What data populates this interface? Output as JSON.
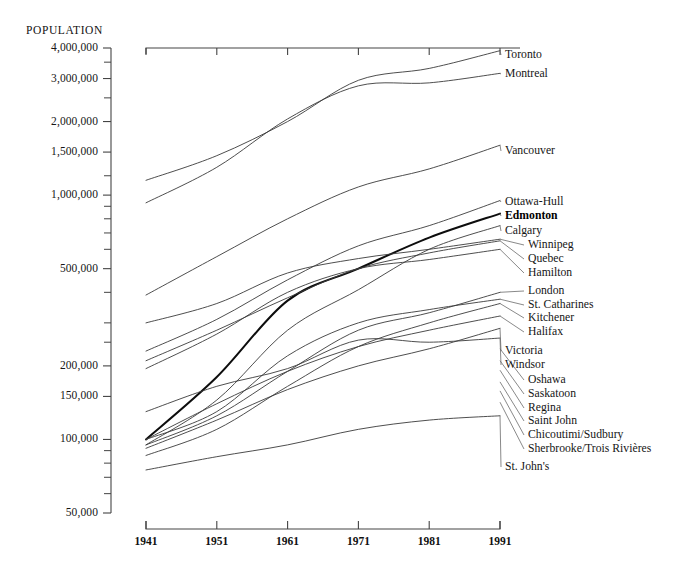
{
  "chart_data": {
    "type": "line",
    "title": "",
    "ylabel": "POPULATION",
    "xlabel": "",
    "yscale": "log",
    "ylim": [
      50000,
      4000000
    ],
    "xlim": [
      1941,
      1991
    ],
    "grid": false,
    "legend_position": "right-inline-labels",
    "x": [
      1941,
      1951,
      1961,
      1971,
      1981,
      1991
    ],
    "ytick_labels": [
      "4,000,000",
      "3,000,000",
      "2,000,000",
      "1,500,000",
      "1,000,000",
      "500,000",
      "200,000",
      "150,000",
      "100,000",
      "50,000"
    ],
    "ytick_values": [
      4000000,
      3000000,
      2000000,
      1500000,
      1000000,
      500000,
      200000,
      150000,
      100000,
      50000
    ],
    "xtick_labels": [
      "1941",
      "1951",
      "1961",
      "1971",
      "1981",
      "1991"
    ],
    "series": [
      {
        "name": "Toronto",
        "emphasis": false,
        "values": [
          1150000,
          1450000,
          2000000,
          2950000,
          3300000,
          3900000
        ]
      },
      {
        "name": "Montreal",
        "emphasis": false,
        "values": [
          930000,
          1300000,
          2050000,
          2800000,
          2880000,
          3150000
        ]
      },
      {
        "name": "Vancouver",
        "emphasis": false,
        "values": [
          390000,
          560000,
          800000,
          1080000,
          1280000,
          1600000
        ]
      },
      {
        "name": "Ottawa-Hull",
        "emphasis": false,
        "values": [
          230000,
          310000,
          450000,
          620000,
          750000,
          950000
        ]
      },
      {
        "name": "Edmonton",
        "emphasis": true,
        "values": [
          100000,
          180000,
          370000,
          500000,
          670000,
          840000
        ]
      },
      {
        "name": "Calgary",
        "emphasis": false,
        "values": [
          95000,
          145000,
          280000,
          410000,
          600000,
          750000
        ]
      },
      {
        "name": "Winnipeg",
        "emphasis": false,
        "values": [
          300000,
          360000,
          480000,
          550000,
          600000,
          660000
        ]
      },
      {
        "name": "Quebec",
        "emphasis": false,
        "values": [
          210000,
          280000,
          380000,
          500000,
          580000,
          650000
        ]
      },
      {
        "name": "Hamilton",
        "emphasis": false,
        "values": [
          195000,
          270000,
          400000,
          500000,
          545000,
          600000
        ]
      },
      {
        "name": "London",
        "emphasis": false,
        "values": [
          95000,
          125000,
          190000,
          280000,
          330000,
          400000
        ]
      },
      {
        "name": "St. Catharines",
        "emphasis": false,
        "values": [
          100000,
          130000,
          220000,
          300000,
          340000,
          375000
        ]
      },
      {
        "name": "Kitchener",
        "emphasis": false,
        "values": [
          86000,
          110000,
          165000,
          240000,
          300000,
          360000
        ]
      },
      {
        "name": "Halifax",
        "emphasis": false,
        "values": [
          100000,
          140000,
          190000,
          240000,
          280000,
          320000
        ]
      },
      {
        "name": "Victoria",
        "emphasis": false,
        "values": [
          92000,
          120000,
          160000,
          200000,
          235000,
          285000
        ]
      },
      {
        "name": "Windsor",
        "emphasis": false,
        "values": [
          130000,
          165000,
          195000,
          255000,
          250000,
          260000
        ]
      },
      {
        "name": "Oshawa",
        "emphasis": false,
        "values": [
          null,
          null,
          null,
          null,
          null,
          235000
        ]
      },
      {
        "name": "Saskatoon",
        "emphasis": false,
        "values": [
          null,
          null,
          null,
          null,
          null,
          210000
        ]
      },
      {
        "name": "Regina",
        "emphasis": false,
        "values": [
          null,
          null,
          null,
          null,
          null,
          192000
        ]
      },
      {
        "name": "Saint John",
        "emphasis": false,
        "values": [
          null,
          null,
          null,
          null,
          null,
          172000
        ]
      },
      {
        "name": "Chicoutimi/Sudbury",
        "emphasis": false,
        "values": [
          null,
          null,
          null,
          null,
          null,
          158000
        ]
      },
      {
        "name": "Sherbrooke/Trois Rivières",
        "emphasis": false,
        "values": [
          null,
          null,
          null,
          null,
          null,
          142000
        ]
      },
      {
        "name": "St. John's",
        "emphasis": false,
        "values": [
          75000,
          85000,
          95000,
          110000,
          120000,
          125000
        ]
      }
    ],
    "right_labels": [
      {
        "text": "Toronto",
        "bold": false
      },
      {
        "text": "Montreal",
        "bold": false
      },
      {
        "text": "Vancouver",
        "bold": false
      },
      {
        "text": "Ottawa-Hull",
        "bold": false
      },
      {
        "text": "Edmonton",
        "bold": true
      },
      {
        "text": "Calgary",
        "bold": false
      },
      {
        "text": "Winnipeg",
        "bold": false
      },
      {
        "text": "Quebec",
        "bold": false
      },
      {
        "text": "Hamilton",
        "bold": false
      },
      {
        "text": "London",
        "bold": false
      },
      {
        "text": "St. Catharines",
        "bold": false
      },
      {
        "text": "Kitchener",
        "bold": false
      },
      {
        "text": "Halifax",
        "bold": false
      },
      {
        "text": "Victoria",
        "bold": false
      },
      {
        "text": "Windsor",
        "bold": false
      },
      {
        "text": "Oshawa",
        "bold": false
      },
      {
        "text": "Saskatoon",
        "bold": false
      },
      {
        "text": "Regina",
        "bold": false
      },
      {
        "text": "Saint John",
        "bold": false
      },
      {
        "text": "Chicoutimi/Sudbury",
        "bold": false
      },
      {
        "text": "Sherbrooke/Trois Rivières",
        "bold": false
      },
      {
        "text": "St. John's",
        "bold": false
      }
    ]
  }
}
